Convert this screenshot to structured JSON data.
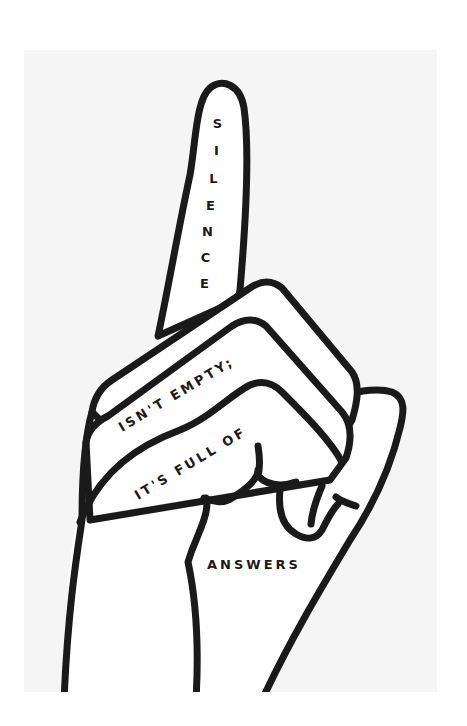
{
  "poster": {
    "background_color": "#ffffff",
    "panel_color": "#f5f5f5",
    "ink_color": "#1a1a1a",
    "hand_fill": "#ffffff"
  },
  "text": {
    "finger_letters": [
      "S",
      "I",
      "L",
      "E",
      "N",
      "C",
      "E"
    ],
    "line2": "ISN'T EMPTY;",
    "line3": "IT'S FULL OF",
    "line4": "ANSWERS"
  },
  "full_quote": "SILENCE ISN'T EMPTY; IT'S FULL OF ANSWERS"
}
